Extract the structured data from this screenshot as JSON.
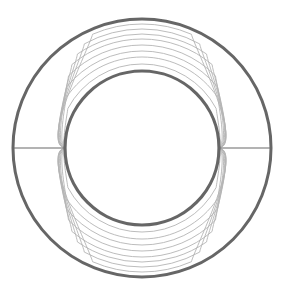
{
  "diagram": {
    "type": "concentric-shield-field-lines",
    "width": 283,
    "height": 293,
    "center": {
      "x": 142,
      "y": 148
    },
    "outer_circle": {
      "r": 129,
      "stroke": "#666666",
      "stroke_width": 3
    },
    "inner_circle": {
      "r": 77,
      "stroke": "#666666",
      "stroke_width": 3.2
    },
    "axis_lines": {
      "stroke": "#9a9a9a",
      "stroke_width": 1.3
    },
    "field_lines": {
      "stroke": "#b4b4b4",
      "stroke_width": 0.9,
      "radii": [
        84,
        91,
        97,
        103,
        109,
        114,
        119,
        124
      ]
    }
  }
}
